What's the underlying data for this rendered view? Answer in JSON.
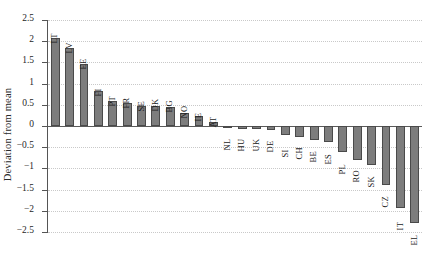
{
  "chart_data": {
    "type": "bar",
    "title": "",
    "xlabel": "",
    "ylabel": "Deviation from mean",
    "ylim": [
      -2.5,
      2.5
    ],
    "ytick_labels": [
      "2.5",
      "2",
      "1.5",
      "1",
      "0.5",
      "0",
      "-0.5",
      "-1",
      "-1.5",
      "-2",
      "-2.5"
    ],
    "ytick_values": [
      2.5,
      2,
      1.5,
      1,
      0.5,
      0,
      -0.5,
      -1,
      -1.5,
      -2,
      -2.5
    ],
    "grid": true,
    "legend": false,
    "bar_color": "#7d7d7d",
    "bar_edge_color": "#4a4a4a",
    "grid_color": "#c9c9c9",
    "axis_color": "#555555",
    "categories": [
      "LT",
      "LV",
      "EE",
      "FI",
      "PT",
      "FR",
      "SE",
      "DK",
      "BG",
      "NO",
      "IE",
      "AT",
      "NL",
      "HU",
      "UK",
      "DE",
      "SI",
      "CH",
      "BE",
      "ES",
      "PL",
      "RO",
      "SK",
      "CZ",
      "IT",
      "EL"
    ],
    "values": [
      2.07,
      1.83,
      1.47,
      0.83,
      0.58,
      0.54,
      0.47,
      0.46,
      0.44,
      0.3,
      0.23,
      0.1,
      -0.04,
      -0.06,
      -0.07,
      -0.09,
      -0.22,
      -0.27,
      -0.32,
      -0.38,
      -0.62,
      -0.8,
      -0.93,
      -1.4,
      -1.93,
      -2.29
    ]
  }
}
